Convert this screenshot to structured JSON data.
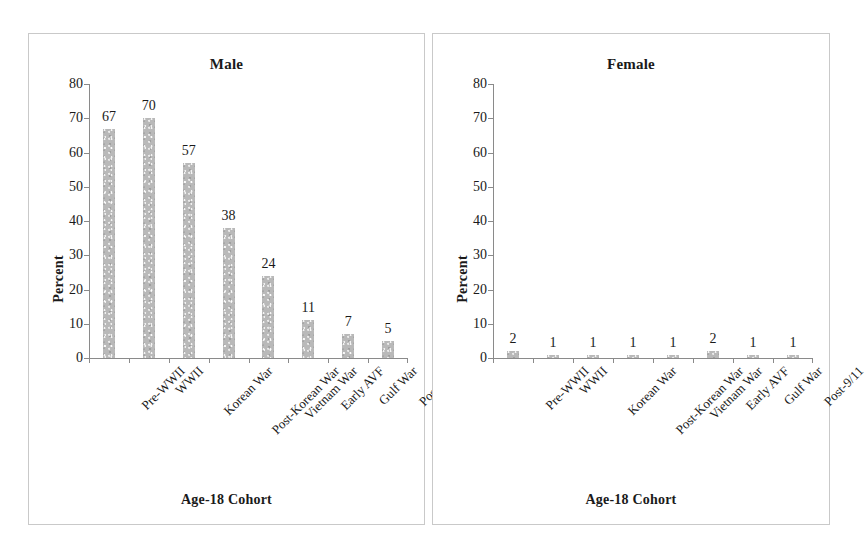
{
  "figure": {
    "background": "#ffffff",
    "bar_color": "#b9b9b9",
    "axis_color": "#8a8a8a",
    "text_color": "#1a1a1a"
  },
  "chart_data": [
    {
      "type": "bar",
      "title": "Male",
      "xlabel": "Age-18 Cohort",
      "ylabel": "Percent",
      "categories": [
        "Pre-WWII",
        "WWII",
        "Korean War",
        "Post-Korean War",
        "Vietnam War",
        "Early AVF",
        "Gulf War",
        "Post-9/11"
      ],
      "values": [
        67,
        70,
        57,
        38,
        24,
        11,
        7,
        5
      ],
      "ylim": [
        0,
        80
      ],
      "yticks": [
        0,
        10,
        20,
        30,
        40,
        50,
        60,
        70,
        80
      ],
      "grid": false,
      "legend": "none",
      "data_labels": true,
      "xtick_rotation": -45
    },
    {
      "type": "bar",
      "title": "Female",
      "xlabel": "Age-18 Cohort",
      "ylabel": "Percent",
      "categories": [
        "Pre-WWII",
        "WWII",
        "Korean War",
        "Post-Korean War",
        "Vietnam War",
        "Early AVF",
        "Gulf War",
        "Post-9/11"
      ],
      "values": [
        2,
        1,
        1,
        1,
        1,
        2,
        1,
        1
      ],
      "ylim": [
        0,
        80
      ],
      "yticks": [
        0,
        10,
        20,
        30,
        40,
        50,
        60,
        70,
        80
      ],
      "grid": false,
      "legend": "none",
      "data_labels": true,
      "xtick_rotation": -45
    }
  ]
}
